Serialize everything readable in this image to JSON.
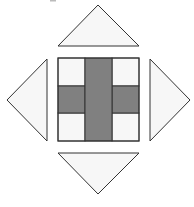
{
  "figure": {
    "colors": {
      "background": "#ffffff",
      "light_fill": "#f7f7f7",
      "dark_fill": "#808080",
      "stroke": "#333333"
    },
    "shapes": {
      "top_triangle": "top-triangle",
      "left_triangle": "left-triangle",
      "right_triangle": "right-triangle",
      "bottom_triangle": "bottom-triangle",
      "center_square": "nine-patch-cross"
    }
  }
}
